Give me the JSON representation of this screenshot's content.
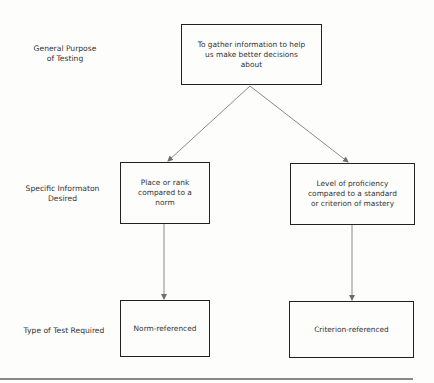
{
  "row_labels": {
    "general_purpose": "General Purpose\nof Testing",
    "specific_information": "Specific Informaton\nDesired",
    "test_type": "Type of Test Required"
  },
  "boxes": {
    "purpose": "To gather information to help\nus make better decisions\nabout",
    "norm_info": "Place or rank\ncompared to a\nnorm",
    "criterion_info": "Level of proficiency\ncompared to a standard\nor criterion of mastery",
    "norm_test": "Norm-referenced",
    "criterion_test": "Criterion-referenced"
  },
  "colors": {
    "box_border": "#222222",
    "arrow": "#8a8a8a",
    "background": "#fdfdfc"
  }
}
